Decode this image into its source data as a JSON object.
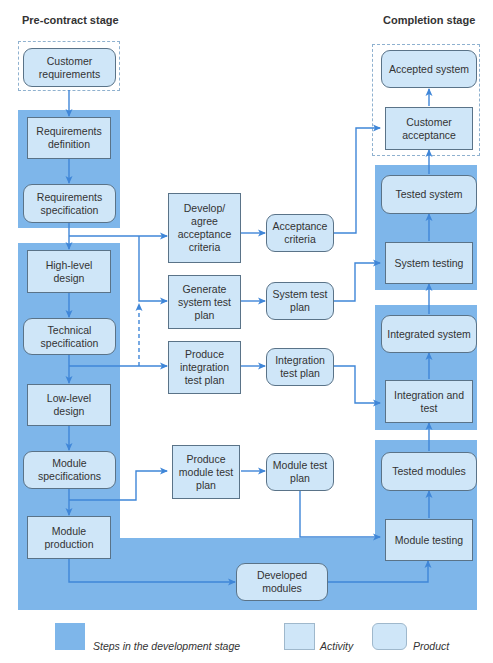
{
  "stages": {
    "left_title": "Pre-contract stage",
    "right_title": "Completion stage"
  },
  "colors": {
    "stage_shade": "#7eb6ea",
    "box_fill": "#cfe6f8",
    "box_border": "#5a7388",
    "arrow": "#3f86d8",
    "dashed_border": "#8fb1cf"
  },
  "nodes": {
    "customer_requirements": {
      "label": "Customer requirements",
      "type": "product"
    },
    "requirements_definition": {
      "label": "Requirements definition",
      "type": "activity"
    },
    "requirements_specification": {
      "label": "Requirements specification",
      "type": "product"
    },
    "high_level_design": {
      "label": "High-level design",
      "type": "activity"
    },
    "technical_specification": {
      "label": "Technical specification",
      "type": "product"
    },
    "low_level_design": {
      "label": "Low-level design",
      "type": "activity"
    },
    "module_specifications": {
      "label": "Module specifications",
      "type": "product"
    },
    "module_production": {
      "label": "Module production",
      "type": "activity"
    },
    "developed_modules": {
      "label": "Developed modules",
      "type": "product"
    },
    "develop_agree_acceptance_criteria": {
      "label": "Develop/ agree acceptance criteria",
      "type": "activity"
    },
    "generate_system_test_plan": {
      "label": "Generate system test plan",
      "type": "activity"
    },
    "produce_integration_test_plan": {
      "label": "Produce integration test plan",
      "type": "activity"
    },
    "produce_module_test_plan": {
      "label": "Produce module test plan",
      "type": "activity"
    },
    "acceptance_criteria": {
      "label": "Acceptance criteria",
      "type": "product"
    },
    "system_test_plan": {
      "label": "System test plan",
      "type": "product"
    },
    "integration_test_plan": {
      "label": "Integration test plan",
      "type": "product"
    },
    "module_test_plan": {
      "label": "Module test plan",
      "type": "product"
    },
    "accepted_system": {
      "label": "Accepted system",
      "type": "product"
    },
    "customer_acceptance": {
      "label": "Customer acceptance",
      "type": "activity"
    },
    "tested_system": {
      "label": "Tested system",
      "type": "product"
    },
    "system_testing": {
      "label": "System testing",
      "type": "activity"
    },
    "integrated_system": {
      "label": "Integrated system",
      "type": "product"
    },
    "integration_and_test": {
      "label": "Integration and test",
      "type": "activity"
    },
    "tested_modules": {
      "label": "Tested modules",
      "type": "product"
    },
    "module_testing": {
      "label": "Module testing",
      "type": "activity"
    }
  },
  "edges": [
    {
      "from": "customer_requirements",
      "to": "requirements_definition"
    },
    {
      "from": "requirements_definition",
      "to": "requirements_specification"
    },
    {
      "from": "requirements_specification",
      "to": "high_level_design"
    },
    {
      "from": "requirements_specification",
      "to": "develop_agree_acceptance_criteria"
    },
    {
      "from": "requirements_specification",
      "to": "generate_system_test_plan"
    },
    {
      "from": "technical_specification",
      "to": "generate_system_test_plan",
      "style": "dashed"
    },
    {
      "from": "high_level_design",
      "to": "technical_specification"
    },
    {
      "from": "technical_specification",
      "to": "low_level_design"
    },
    {
      "from": "technical_specification",
      "to": "produce_integration_test_plan"
    },
    {
      "from": "low_level_design",
      "to": "module_specifications"
    },
    {
      "from": "module_specifications",
      "to": "module_production"
    },
    {
      "from": "module_specifications",
      "to": "produce_module_test_plan"
    },
    {
      "from": "module_production",
      "to": "developed_modules"
    },
    {
      "from": "developed_modules",
      "to": "module_testing"
    },
    {
      "from": "develop_agree_acceptance_criteria",
      "to": "acceptance_criteria"
    },
    {
      "from": "generate_system_test_plan",
      "to": "system_test_plan"
    },
    {
      "from": "produce_integration_test_plan",
      "to": "integration_test_plan"
    },
    {
      "from": "produce_module_test_plan",
      "to": "module_test_plan"
    },
    {
      "from": "acceptance_criteria",
      "to": "customer_acceptance"
    },
    {
      "from": "system_test_plan",
      "to": "system_testing"
    },
    {
      "from": "integration_test_plan",
      "to": "integration_and_test"
    },
    {
      "from": "module_test_plan",
      "to": "module_testing"
    },
    {
      "from": "module_testing",
      "to": "tested_modules"
    },
    {
      "from": "tested_modules",
      "to": "integration_and_test"
    },
    {
      "from": "integration_and_test",
      "to": "integrated_system"
    },
    {
      "from": "integrated_system",
      "to": "system_testing"
    },
    {
      "from": "system_testing",
      "to": "tested_system"
    },
    {
      "from": "tested_system",
      "to": "customer_acceptance"
    },
    {
      "from": "customer_acceptance",
      "to": "accepted_system"
    }
  ],
  "legend": {
    "steps": "Steps in the development stage",
    "activity": "Activity",
    "product": "Product"
  }
}
